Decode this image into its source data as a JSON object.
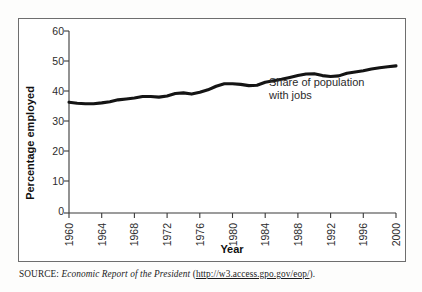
{
  "figure": {
    "source_prefix": "SOURCE:",
    "source_title": "Economic Report of the President",
    "source_paren_open": "(",
    "source_url": "http://w3.access.gpo.gov/eop/",
    "source_paren_close": ")."
  },
  "chart_data": {
    "type": "line",
    "title": "",
    "xlabel": "Year",
    "ylabel": "Percentage employed",
    "xlim": [
      1960,
      2000
    ],
    "ylim": [
      0,
      60
    ],
    "grid": false,
    "legend": "none",
    "annotations": [
      {
        "text_line1": "Share of population",
        "text_line2": "with jobs",
        "x": 1987,
        "y": 42
      }
    ],
    "xticks": [
      "1960",
      "1964",
      "1968",
      "1972",
      "1976",
      "1980",
      "1984",
      "1988",
      "1992",
      "1996",
      "2000"
    ],
    "yticks": [
      "0",
      "10",
      "20",
      "30",
      "40",
      "50",
      "60"
    ],
    "series": [
      {
        "name": "Share of population with jobs",
        "color": "#141414",
        "x": [
          1960,
          1961,
          1962,
          1963,
          1964,
          1965,
          1966,
          1967,
          1968,
          1969,
          1970,
          1971,
          1972,
          1973,
          1974,
          1975,
          1976,
          1977,
          1978,
          1979,
          1980,
          1981,
          1982,
          1983,
          1984,
          1985,
          1986,
          1987,
          1988,
          1989,
          1990,
          1991,
          1992,
          1993,
          1994,
          1995,
          1996,
          1997,
          1998,
          1999,
          2000
        ],
        "values": [
          36.5,
          36.2,
          36.0,
          36.0,
          36.3,
          36.7,
          37.3,
          37.6,
          37.9,
          38.4,
          38.4,
          38.2,
          38.6,
          39.4,
          39.6,
          39.2,
          39.8,
          40.6,
          41.8,
          42.6,
          42.6,
          42.4,
          42.0,
          42.1,
          43.1,
          43.6,
          44.1,
          44.7,
          45.3,
          45.8,
          45.9,
          45.3,
          45.0,
          45.2,
          46.1,
          46.5,
          46.9,
          47.5,
          47.9,
          48.2,
          48.5
        ]
      }
    ]
  }
}
